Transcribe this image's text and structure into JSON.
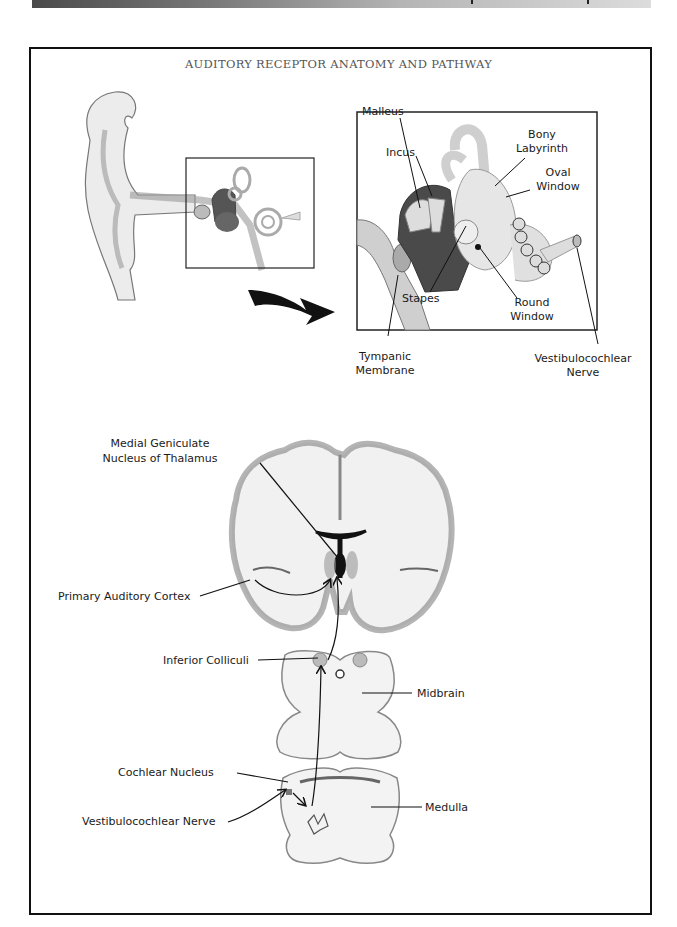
{
  "header": {
    "bar": "gradient-bar"
  },
  "title": "AUDITORY RECEPTOR ANATOMY AND PATHWAY",
  "ear_labels": {
    "malleus": "Malleus",
    "incus": "Incus",
    "bony_labyrinth_1": "Bony",
    "bony_labyrinth_2": "Labyrinth",
    "oval_window_1": "Oval",
    "oval_window_2": "Window",
    "stapes": "Stapes",
    "round_window_1": "Round",
    "round_window_2": "Window",
    "tympanic_1": "Tympanic",
    "tympanic_2": "Membrane",
    "vestibulocochlear_1": "Vestibulocochlear",
    "vestibulocochlear_2": "Nerve"
  },
  "brain_labels": {
    "mgn_1": "Medial Geniculate",
    "mgn_2": "Nucleus of Thalamus",
    "primary_auditory_cortex": "Primary Auditory Cortex",
    "inferior_colliculi": "Inferior Colliculi",
    "midbrain": "Midbrain",
    "cochlear_nucleus": "Cochlear Nucleus",
    "vestibulocochlear_nerve": "Vestibulocochlear Nerve",
    "medulla": "Medulla"
  }
}
